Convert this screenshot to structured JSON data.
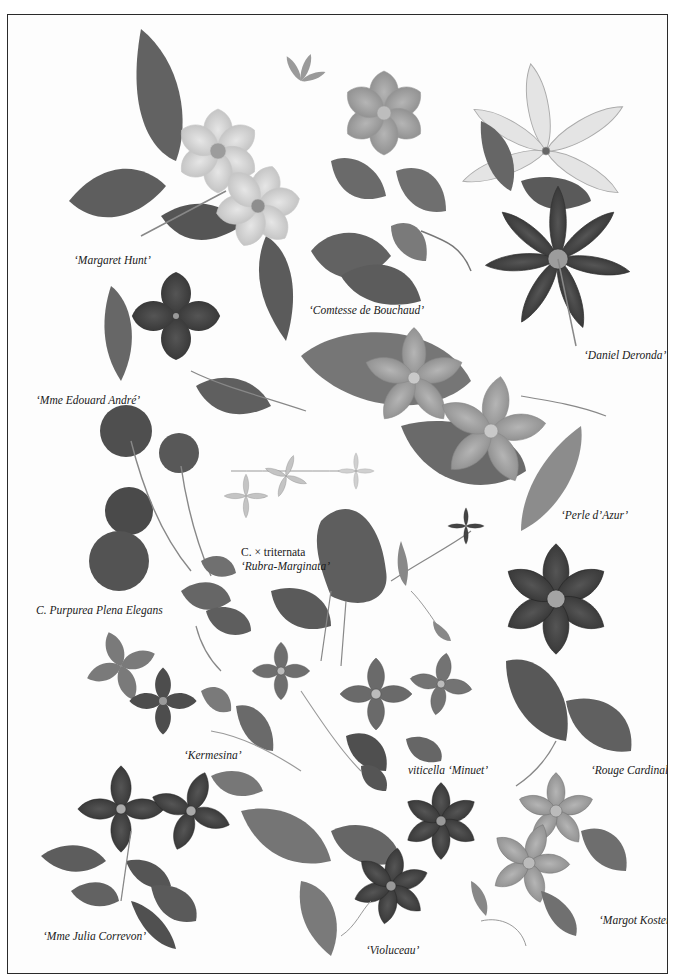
{
  "plate": {
    "type": "botanical plate",
    "subject": "Clematis varieties",
    "tone": "grayscale photograph",
    "border_color": "#2a2a2a",
    "background": "#fdfdfd"
  },
  "labels": [
    {
      "id": "margaret-hunt",
      "text": "‘Margaret Hunt’",
      "x": 73,
      "y": 252
    },
    {
      "id": "comtesse-de-bouchaud",
      "text": "‘Comtesse de Bouchaud’",
      "x": 308,
      "y": 302
    },
    {
      "id": "daniel-deronda",
      "text": "‘Daniel Deronda’",
      "x": 583,
      "y": 347
    },
    {
      "id": "mme-edouard-andre",
      "text": "‘Mme Edouard André’",
      "x": 35,
      "y": 392
    },
    {
      "id": "perle-d-azur",
      "text": "‘Perle d’Azur’",
      "x": 560,
      "y": 507
    },
    {
      "id": "triternata-line1",
      "text": "C. × triternata",
      "x": 240,
      "y": 544
    },
    {
      "id": "triternata-line2",
      "text": "‘Rubra-Marginata’",
      "x": 240,
      "y": 558
    },
    {
      "id": "purpurea-plena-elegans",
      "text": "C. Purpurea Plena Elegans",
      "x": 35,
      "y": 602
    },
    {
      "id": "kermesina",
      "text": "‘Kermesina’",
      "x": 183,
      "y": 747
    },
    {
      "id": "viticella-minuet",
      "text": "viticella ‘Minuet’",
      "x": 407,
      "y": 762
    },
    {
      "id": "rouge-cardinal",
      "text": "‘Rouge Cardinal’",
      "x": 590,
      "y": 762
    },
    {
      "id": "mme-julia-correvon",
      "text": "‘Mme Julia Correvon’",
      "x": 42,
      "y": 928
    },
    {
      "id": "violuceau",
      "text": "‘Violuceau’",
      "x": 365,
      "y": 942
    },
    {
      "id": "margot-koster",
      "text": "‘Margot Koster’",
      "x": 598,
      "y": 912
    }
  ],
  "colors": {
    "leaf_dark": "#5a5a5a",
    "leaf_mid": "#7a7a7a",
    "leaf_light": "#9a9a9a",
    "petal_pale": "#d8d8d8",
    "petal_mid": "#a8a8a8",
    "petal_dark": "#3e3e3e",
    "stem": "#8a8a8a"
  }
}
